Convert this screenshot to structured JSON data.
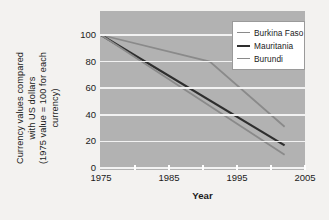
{
  "chart_data": {
    "type": "line",
    "title": "",
    "xlabel": "Year",
    "ylabel": "Currency values compared with US dollars (1975 value = 100 for each currency)",
    "ylabel_lines": [
      "Currency values compared",
      "with US dollars",
      "(1975 value = 100 for each",
      "currency)"
    ],
    "xlim": [
      1975,
      2005
    ],
    "ylim": [
      0,
      100
    ],
    "xticks": [
      1975,
      1985,
      1995,
      2005
    ],
    "xtick_labels": [
      "1975",
      "1985",
      "1995",
      "2005"
    ],
    "xminor_ticks": [
      1980,
      1985,
      1990,
      1995,
      2000,
      2005
    ],
    "yticks": [
      0,
      20,
      40,
      60,
      80,
      100
    ],
    "ytick_labels": [
      "0",
      "20",
      "40",
      "60",
      "80",
      "100"
    ],
    "grid": "horizontal",
    "plot_background": "#b2b2b2",
    "gridline_color": "#f2f2f2",
    "legend_position": "top-right",
    "series": [
      {
        "name": "Burkina Faso",
        "color": "#8a8a8a",
        "width": 1.8,
        "x": [
          1975,
          1991,
          2002
        ],
        "values": [
          100,
          80,
          31
        ]
      },
      {
        "name": "Mauritania",
        "color": "#2e2e2e",
        "width": 2.2,
        "x": [
          1975,
          2002
        ],
        "values": [
          100,
          17
        ]
      },
      {
        "name": "Burundi",
        "color": "#8a8a8a",
        "width": 1.8,
        "x": [
          1975,
          2002
        ],
        "values": [
          100,
          10
        ]
      }
    ]
  }
}
